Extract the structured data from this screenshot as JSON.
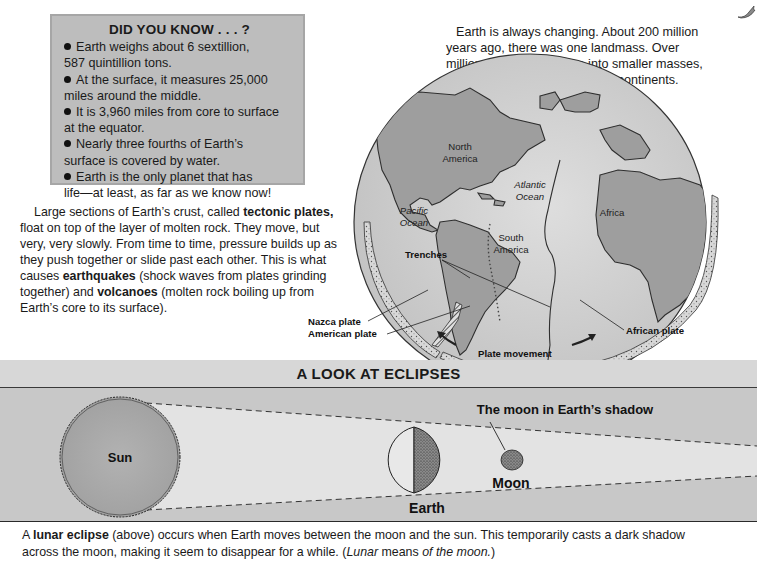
{
  "fact_box": {
    "title": "DID YOU KNOW . . . ?",
    "items": [
      {
        "line1": "Earth weighs about 6 sextillion,",
        "line2": "587 quintillion tons."
      },
      {
        "line1": "At the surface, it measures 25,000",
        "line2": "miles around the middle."
      },
      {
        "line1": "It is 3,960 miles from core to surface",
        "line2": "at the equator."
      },
      {
        "line1": "Nearly three fourths of Earth’s",
        "line2": "surface is covered by water."
      },
      {
        "line1": "Earth is the only planet that has",
        "line2": "life—at least, as far as we know now!"
      }
    ]
  },
  "intro_paragraph": {
    "lines": [
      "Earth is always changing. About 200 million",
      "years ago, there was one landmass. Over",
      "millions of years, it broke into smaller masses,",
      "now the continents."
    ]
  },
  "plates_paragraph": {
    "l1_pre": "Large sections of Earth’s crust, called ",
    "l1_bold": "tectonic plates,",
    "l2": "float on top of the layer of molten rock. They move, but",
    "l3": "very, very slowly. From time to time, pressure builds up as",
    "l4": "they push together or slide past each other. This is what",
    "l5_pre": "causes ",
    "l5_bold": "earthquakes",
    "l5_post": " (shock waves from plates grinding",
    "l6_pre": "together) and ",
    "l6_bold": "volcanoes",
    "l6_post": " (molten rock boiling up from",
    "l7": "Earth’s core to its surface)."
  },
  "globe": {
    "labels": {
      "north_america_1": "North",
      "north_america_2": "America",
      "atlantic_1": "Atlantic",
      "atlantic_2": "Ocean",
      "pacific_1": "Pacific",
      "pacific_2": "Ocean",
      "south_america_1": "South",
      "south_america_2": "America",
      "africa": "Africa"
    },
    "callouts": {
      "trenches": "Trenches",
      "nazca_plate": "Nazca plate",
      "american_plate": "American plate",
      "african_plate": "African plate",
      "plate_movement": "Plate movement"
    }
  },
  "eclipse": {
    "title": "A LOOK AT ECLIPSES",
    "labels": {
      "sun": "Sun",
      "earth": "Earth",
      "moon": "Moon",
      "moon_shadow": "The moon in Earth’s shadow"
    },
    "caption": {
      "l1_pre": "A ",
      "l1_bold": "lunar eclipse",
      "l1_post": " (above) occurs when Earth moves between the moon and the sun. This temporarily casts a dark shadow",
      "l2_pre": "across the moon, making it seem to disappear for a while. (",
      "l2_it1": "Lunar",
      "l2_mid": " means ",
      "l2_it2": "of the moon.",
      "l2_post": ")"
    }
  },
  "colors": {
    "fact_box_bg": "#bdbdbd",
    "banner_bg": "#c8c8c8",
    "land": "#9a9a9a",
    "ocean": "#cfcfcf"
  }
}
